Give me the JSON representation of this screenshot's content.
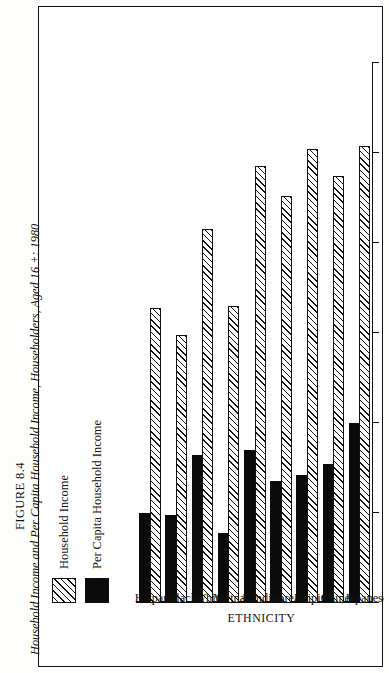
{
  "caption": {
    "figure_number": "FIGURE 8.4",
    "title": "Household Income and Per Capita Household Income, Householders, Aged 16 +: 1980"
  },
  "legend": {
    "position": "top-left",
    "items": [
      {
        "label": "Household Income",
        "swatch": "hatch-diagonal",
        "color": "#111111"
      },
      {
        "label": "Per Capita Household Income",
        "swatch": "solid-black",
        "color": "#0b0b0b"
      }
    ]
  },
  "chart_data": {
    "type": "bar",
    "orientation": "horizontal",
    "title": "Household Income and Per Capita Household Income, Householders, Aged 16 +: 1980",
    "xlabel": "ETHNICITY",
    "ylabel": "INCOME IN THOUSANDS",
    "categories": [
      "Japanese",
      "Chinese",
      "Filipino",
      "Korean",
      "A.Indian",
      "Vietnam.",
      "White",
      "Black",
      "Hispanic"
    ],
    "series": [
      {
        "name": "Household Income",
        "values": [
          25.4,
          23.7,
          25.2,
          22.6,
          24.3,
          16.5,
          20.8,
          14.9,
          16.4
        ]
      },
      {
        "name": "Per Capita Household Income",
        "values": [
          10.0,
          7.7,
          7.1,
          6.8,
          8.5,
          3.9,
          8.2,
          4.9,
          5.0
        ]
      }
    ],
    "ylim": [
      0,
      30
    ],
    "yticks": [
      0,
      5,
      10,
      15,
      20,
      25,
      30
    ],
    "ytick_labels": [
      "0",
      "5",
      "10",
      "15",
      "20",
      "25",
      "30"
    ],
    "grid": false,
    "legend_position": "top-left"
  }
}
